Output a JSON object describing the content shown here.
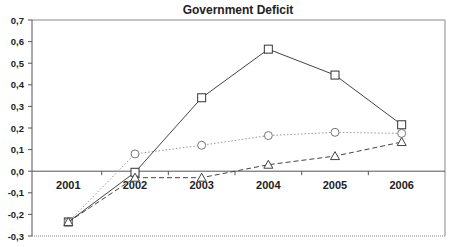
{
  "chart_data": {
    "type": "line",
    "title": "Government Deficit",
    "xlabel": "",
    "ylabel": "",
    "categories": [
      "2001",
      "2002",
      "2003",
      "2004",
      "2005",
      "2006"
    ],
    "ylim": [
      -0.3,
      0.7
    ],
    "yticks": [
      "0,7",
      "0,6",
      "0,5",
      "0,4",
      "0,3",
      "0,2",
      "0,1",
      "0,0",
      "-0,1",
      "-0,2",
      "-0,3"
    ],
    "grid": false,
    "legend": null,
    "series": [
      {
        "name": "square-solid",
        "marker": "square",
        "line": "solid",
        "values": [
          -0.235,
          -0.005,
          0.34,
          0.565,
          0.445,
          0.215
        ]
      },
      {
        "name": "circle-dotted",
        "marker": "circle",
        "line": "dotted",
        "values": [
          -0.235,
          0.08,
          0.12,
          0.165,
          0.18,
          0.175
        ]
      },
      {
        "name": "triangle-dashed",
        "marker": "triangle",
        "line": "dashed",
        "values": [
          -0.235,
          -0.03,
          -0.03,
          0.03,
          0.07,
          0.135
        ]
      }
    ]
  }
}
